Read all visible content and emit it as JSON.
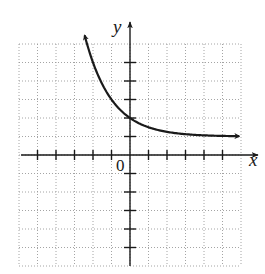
{
  "chart_data": {
    "type": "line",
    "title": "",
    "xlabel": "x",
    "ylabel": "y",
    "origin_label": "0",
    "xlim": [
      -6,
      6
    ],
    "ylim": [
      -6,
      6
    ],
    "grid": true,
    "grid_style": "dotted",
    "tick_spacing": 1,
    "x_ticks": [
      -5,
      -4,
      -3,
      -2,
      -1,
      1,
      2,
      3,
      4,
      5
    ],
    "y_ticks": [
      -5,
      -4,
      -3,
      -2,
      -1,
      1,
      2,
      3,
      4,
      5
    ],
    "series": [
      {
        "name": "y = 2^(-x) + 1",
        "x": [
          -2.45,
          -2,
          -1.5,
          -1,
          -0.5,
          0,
          0.5,
          1,
          2,
          3,
          4,
          5,
          5.9
        ],
        "y": [
          6.46,
          5,
          3.83,
          3,
          2.41,
          2,
          1.71,
          1.5,
          1.25,
          1.13,
          1.06,
          1.03,
          1.02
        ],
        "arrows": "both",
        "horizontal_asymptote": 1,
        "y_intercept": 2
      }
    ],
    "colors": {
      "axis": "#1a1a1a",
      "curve": "#1a1a1a",
      "grid": "#9a9a9a"
    }
  }
}
